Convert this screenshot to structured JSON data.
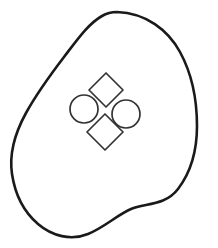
{
  "figure": {
    "title": "Line drawing of an irregular closed blob containing four shapes",
    "type": "line-art",
    "canvas": {
      "width": 218,
      "height": 248,
      "background_color": "#ffffff"
    },
    "strokes": {
      "outline_color": "#1a1a1a",
      "outline_width": 2.6,
      "inner_color": "#333333",
      "inner_width": 1.7,
      "linejoin": "round",
      "linecap": "round"
    },
    "outline": {
      "name": "blob-outline",
      "closed": true,
      "description": "Irregular rounded closed contour, widest on the right, with a slight concave kink along the lower-right edge",
      "bounds": {
        "x_min": 12,
        "y_min": 11,
        "x_max": 198,
        "y_max": 238
      },
      "path": "M 117 12 C 146 13 168 30 180 52 C 192 74 197 100 197 126 C 197 150 191 172 178 189 C 165 206 145 203 131 209 C 117 215 105 227 88 234 C 71 241 52 236 38 224 C 24 212 15 194 12 174 C 9 154 15 133 26 113 C 37 93 51 74 64 57 C 77 40 88 24 102 16 C 107 13 112 12 117 12 Z"
    },
    "inner_shapes": [
      {
        "name": "top-diamond",
        "kind": "rotated-square",
        "center": {
          "x": 106,
          "y": 90
        },
        "size": 24,
        "rotation_deg": 42,
        "points": "106,73 123,90 106,107 89,90"
      },
      {
        "name": "left-circle",
        "kind": "circle",
        "center": {
          "x": 84,
          "y": 109
        },
        "radius": 14
      },
      {
        "name": "right-circle",
        "kind": "circle",
        "center": {
          "x": 126,
          "y": 114
        },
        "radius": 14
      },
      {
        "name": "bottom-diamond",
        "kind": "rotated-square",
        "center": {
          "x": 105,
          "y": 132
        },
        "size": 24,
        "rotation_deg": 45,
        "points": "105,114 123,132 105,150 87,132"
      }
    ]
  }
}
